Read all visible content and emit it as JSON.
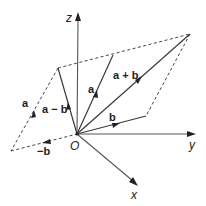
{
  "diagram": {
    "origin": {
      "label": "O",
      "x": 77,
      "y": 134
    },
    "axes": [
      {
        "name": "z",
        "label": "z",
        "end": [
          78,
          14
        ],
        "label_pos": [
          66,
          22
        ]
      },
      {
        "name": "y",
        "label": "y",
        "end": [
          194,
          134
        ],
        "label_pos": [
          189,
          148
        ]
      },
      {
        "name": "x",
        "label": "x",
        "end": [
          137,
          186
        ],
        "label_pos": [
          131,
          198
        ]
      }
    ],
    "vectors": [
      {
        "name": "a",
        "label": "a",
        "tip": [
          113,
          55
        ],
        "label_pos": [
          88,
          95
        ]
      },
      {
        "name": "b",
        "label": "b",
        "tip": [
          146,
          116
        ],
        "label_pos": [
          110,
          122
        ]
      },
      {
        "name": "a+b",
        "label": "a + b",
        "tip": [
          190,
          34
        ],
        "label_pos": [
          112,
          79
        ]
      },
      {
        "name": "a-b",
        "label": "a − b",
        "tip": [
          58,
          68
        ],
        "label_pos": [
          43,
          111
        ]
      },
      {
        "name": "-b",
        "label": "−b",
        "tip": [
          11,
          151
        ],
        "label_pos": [
          36,
          155
        ],
        "dashed": true
      },
      {
        "name": "a-dashed",
        "label": "a",
        "from": [
          11,
          151
        ],
        "tip": [
          58,
          68
        ],
        "label_pos": [
          22,
          106
        ],
        "dashed": true
      }
    ],
    "dashed_edges": [
      {
        "from": [
          58,
          68
        ],
        "to": [
          190,
          34
        ]
      },
      {
        "from": [
          190,
          34
        ],
        "to": [
          146,
          116
        ]
      }
    ],
    "labels": {
      "z": "z",
      "y": "y",
      "x": "x",
      "origin": "O",
      "a": "a",
      "b": "b",
      "a_plus_b": "a + b",
      "a_minus_b": "a − b",
      "neg_b": "−b",
      "a_dashed": "a"
    },
    "colors": {
      "line": "#3a3a3a",
      "axis": "#555555",
      "background": "#ffffff"
    }
  }
}
